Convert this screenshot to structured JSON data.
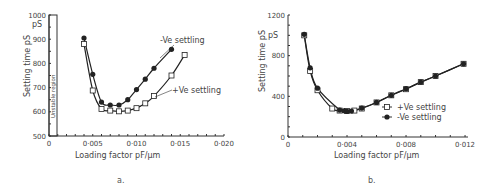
{
  "figure": {
    "caption_a": "a.",
    "caption_b": "b."
  },
  "chart_data": [
    {
      "id": "a",
      "type": "line",
      "title": "",
      "xlabel": "Loading factor pF/μm",
      "ylabel": "Setting time pS",
      "y_unit_label": "pS",
      "xlim": [
        0,
        0.02
      ],
      "ylim": [
        500,
        1000
      ],
      "x_ticks": [
        "0",
        "0·005",
        "0·010",
        "0·015",
        "0·020"
      ],
      "y_ticks": [
        "500",
        "600",
        "700",
        "800",
        "900",
        "1000"
      ],
      "annotation": "Unstable region",
      "grid": false,
      "series": [
        {
          "name": "-Ve settling",
          "marker": "filled-circle",
          "x": [
            0.004,
            0.005,
            0.006,
            0.007,
            0.008,
            0.009,
            0.01,
            0.011,
            0.012,
            0.014
          ],
          "y": [
            905,
            755,
            640,
            628,
            628,
            650,
            692,
            735,
            780,
            858
          ]
        },
        {
          "name": "+Ve settling",
          "marker": "open-square",
          "x": [
            0.004,
            0.005,
            0.006,
            0.007,
            0.008,
            0.009,
            0.01,
            0.011,
            0.012,
            0.014,
            0.0155
          ],
          "y": [
            880,
            688,
            612,
            605,
            602,
            605,
            615,
            635,
            665,
            750,
            835
          ]
        }
      ],
      "legend": [
        {
          "label": "-Ve settling",
          "position": "inline-label"
        },
        {
          "label": "+Ve settling",
          "position": "inline-label"
        }
      ]
    },
    {
      "id": "b",
      "type": "line",
      "title": "",
      "xlabel": "Loading factor pF/μm",
      "ylabel": "Setting time pS",
      "y_unit_label": "pS",
      "xlim": [
        0,
        0.0122
      ],
      "ylim": [
        0,
        1200
      ],
      "x_ticks": [
        "0",
        "0·004",
        "0·008",
        "0·012"
      ],
      "y_ticks": [
        "0",
        "400",
        "800",
        "1200"
      ],
      "grid": false,
      "series": [
        {
          "name": "+Ve settling",
          "marker": "open-square",
          "x": [
            0.0011,
            0.0015,
            0.002,
            0.003,
            0.0035,
            0.004,
            0.0045,
            0.005,
            0.006,
            0.007,
            0.008,
            0.009,
            0.01,
            0.0119
          ],
          "y": [
            1000,
            650,
            460,
            280,
            260,
            255,
            260,
            280,
            340,
            410,
            470,
            540,
            600,
            720
          ]
        },
        {
          "name": "-Ve settling",
          "marker": "filled-circle",
          "x": [
            0.0011,
            0.0015,
            0.002,
            0.0035,
            0.0038,
            0.004,
            0.0043,
            0.005,
            0.006,
            0.007,
            0.008,
            0.009,
            0.01,
            0.0119
          ],
          "y": [
            1010,
            680,
            480,
            265,
            258,
            252,
            255,
            285,
            340,
            410,
            475,
            540,
            600,
            720
          ]
        }
      ],
      "legend": [
        {
          "label": "+Ve settling",
          "marker": "open-square"
        },
        {
          "label": "-Ve settling",
          "marker": "filled-circle"
        }
      ],
      "legend_position": "lower-right inside plot"
    }
  ]
}
